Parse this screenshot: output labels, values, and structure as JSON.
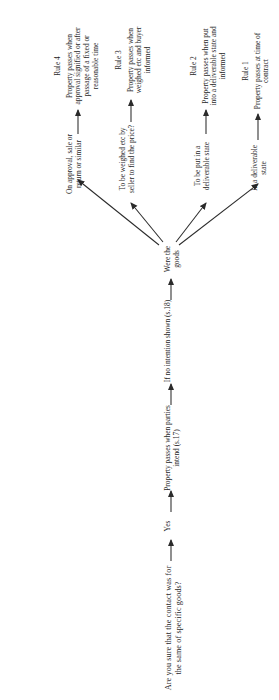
{
  "diagram": {
    "type": "flowchart",
    "orientation": "rotated-90-ccw",
    "title": "Are you sure that the contact was for the same of specific goods?",
    "chain": [
      {
        "id": "yes",
        "label": "Yes"
      },
      {
        "id": "s17",
        "label": "Property passes when parties intend (s.17)"
      },
      {
        "id": "s18",
        "label": "If no intention shown (s.18)"
      },
      {
        "id": "were-goods",
        "label": "Were the goods"
      }
    ],
    "branches": [
      {
        "id": "rule1",
        "condition": "In a deliverable state",
        "rule_name": "Rule 1",
        "rule_text": "Property passes at time of contract"
      },
      {
        "id": "rule2",
        "condition": "To be put in a deliverable state",
        "rule_name": "Rule 2",
        "rule_text": "Property passes when put into a deliverable state and informed"
      },
      {
        "id": "rule3",
        "condition": "To be weighed etc by seller to find the price?",
        "rule_name": "Rule 3",
        "rule_text": "Property passes when weighed etc and buyer informed"
      },
      {
        "id": "rule4",
        "condition": "On approval, sale or return or similar",
        "rule_name": "Rule 4",
        "rule_text": "Property passes when approval signified or after passage of a fixed or reasonable time"
      }
    ],
    "colors": {
      "ink": "#1f1f1f",
      "line": "#2b2b2b",
      "background": "#ffffff"
    }
  }
}
